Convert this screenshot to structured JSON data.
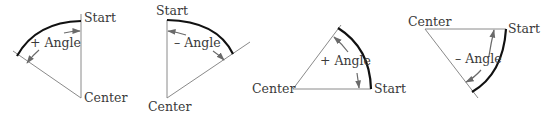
{
  "diagrams": [
    {
      "id": "positive-angle-counterclockwise",
      "start_label": "Start",
      "center_label": "Center",
      "angle_label": "+ Angle"
    },
    {
      "id": "negative-angle-clockwise",
      "start_label": "Start",
      "center_label": "Center",
      "angle_label": "– Angle"
    },
    {
      "id": "positive-angle-from-horizontal",
      "start_label": "Start",
      "center_label": "Center",
      "angle_label": "+ Angle"
    },
    {
      "id": "negative-angle-from-horizontal",
      "start_label": "Start",
      "center_label": "Center",
      "angle_label": "– Angle"
    }
  ],
  "colors": {
    "arc": "#111111",
    "radius_line": "#8a8a8a",
    "arrow": "#6a6a6a",
    "text": "#3a3a3a",
    "background": "#ffffff"
  }
}
